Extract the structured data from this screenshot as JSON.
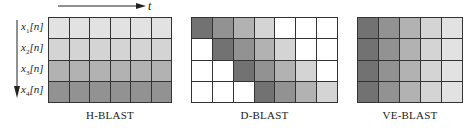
{
  "time_axis": {
    "label": "t"
  },
  "stream_axis": {
    "labels": [
      {
        "base": "x",
        "sub": "1",
        "suffix": "[n]"
      },
      {
        "base": "x",
        "sub": "2",
        "suffix": "[n]"
      },
      {
        "base": "x",
        "sub": "3",
        "suffix": "[n]"
      },
      {
        "base": "x",
        "sub": "4",
        "suffix": "[n]"
      }
    ]
  },
  "colors": {
    "white": "#ffffff",
    "l1": "#e2e2e2",
    "l2": "#d4d4d4",
    "l3": "#b2b2b2",
    "l4": "#929292",
    "l5": "#727272",
    "grid_line": "#333333"
  },
  "schemes": [
    {
      "name": "H-BLAST",
      "cols": 6,
      "rows": 4,
      "cells": [
        [
          "l1",
          "l1",
          "l1",
          "l1",
          "l1",
          "l1"
        ],
        [
          "l2",
          "l2",
          "l2",
          "l2",
          "l2",
          "l2"
        ],
        [
          "l3",
          "l3",
          "l3",
          "l3",
          "l3",
          "l3"
        ],
        [
          "l4",
          "l4",
          "l4",
          "l4",
          "l4",
          "l4"
        ]
      ]
    },
    {
      "name": "D-BLAST",
      "cols": 7,
      "rows": 4,
      "cells": [
        [
          "l5",
          "l4",
          "l3",
          "l2",
          "white",
          "white",
          "white"
        ],
        [
          "white",
          "l5",
          "l4",
          "l3",
          "l2",
          "white",
          "white"
        ],
        [
          "white",
          "white",
          "l5",
          "l4",
          "l3",
          "l2",
          "white"
        ],
        [
          "white",
          "white",
          "white",
          "l5",
          "l4",
          "l3",
          "l2"
        ]
      ]
    },
    {
      "name": "VE-BLAST",
      "cols": 5,
      "rows": 4,
      "cells": [
        [
          "l5",
          "l4",
          "l3",
          "l2",
          "l1"
        ],
        [
          "l5",
          "l4",
          "l3",
          "l2",
          "l1"
        ],
        [
          "l5",
          "l4",
          "l3",
          "l2",
          "l1"
        ],
        [
          "l5",
          "l4",
          "l3",
          "l2",
          "l1"
        ]
      ]
    }
  ]
}
